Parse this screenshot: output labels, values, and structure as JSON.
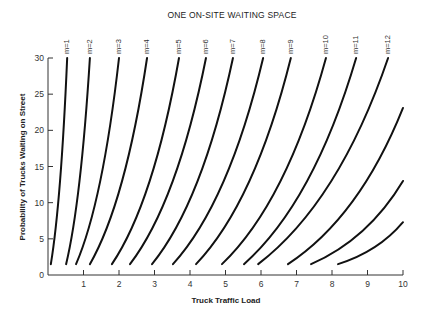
{
  "chart_data": {
    "type": "line",
    "title": "ONE ON-SITE WAITING SPACE",
    "xlabel": "Truck Traffic Load",
    "ylabel": "Probability of Trucks Waiting on Street",
    "xlim": [
      0,
      10
    ],
    "ylim": [
      0,
      30
    ],
    "x_ticks": [
      1,
      2,
      3,
      4,
      5,
      6,
      7,
      8,
      9,
      10
    ],
    "x_tick_labels": [
      "1",
      "2",
      "3",
      "4",
      "5",
      "6",
      "7",
      "8",
      "9",
      "10"
    ],
    "y_ticks": [
      0,
      5,
      10,
      15,
      20,
      25,
      30
    ],
    "y_tick_labels": [
      "0",
      "5",
      "10",
      "15",
      "20",
      "25",
      "30"
    ],
    "grid": false,
    "legend": "inline labels at top of each curve",
    "series": [
      {
        "name": "m=1",
        "start": [
          0.08,
          1.5
        ],
        "end": [
          0.54,
          30
        ]
      },
      {
        "name": "m=2",
        "start": [
          0.51,
          1.5
        ],
        "end": [
          1.18,
          30
        ]
      },
      {
        "name": "m=3",
        "start": [
          0.79,
          1.5
        ],
        "end": [
          2.0,
          30
        ]
      },
      {
        "name": "m=4",
        "start": [
          1.18,
          1.5
        ],
        "end": [
          2.79,
          30
        ]
      },
      {
        "name": "m=5",
        "start": [
          1.8,
          1.5
        ],
        "end": [
          3.69,
          30
        ]
      },
      {
        "name": "m=6",
        "start": [
          2.31,
          1.5
        ],
        "end": [
          4.45,
          30
        ]
      },
      {
        "name": "m=7",
        "start": [
          2.93,
          1.5
        ],
        "end": [
          5.21,
          30
        ]
      },
      {
        "name": "m=8",
        "start": [
          3.52,
          1.5
        ],
        "end": [
          6.06,
          30
        ]
      },
      {
        "name": "m=9",
        "start": [
          4.17,
          1.5
        ],
        "end": [
          6.84,
          30
        ]
      },
      {
        "name": "m=10",
        "start": [
          4.9,
          1.5
        ],
        "end": [
          7.83,
          30
        ]
      },
      {
        "name": "m=11",
        "start": [
          5.52,
          1.5
        ],
        "end": [
          8.68,
          30
        ]
      },
      {
        "name": "m=12",
        "start": [
          5.92,
          1.5
        ],
        "end": [
          9.58,
          30
        ]
      },
      {
        "name": "m=13",
        "start": [
          6.76,
          1.5
        ],
        "end": [
          10,
          23.1
        ],
        "unlabeled": true
      },
      {
        "name": "m=14",
        "start": [
          7.41,
          1.5
        ],
        "end": [
          10,
          13.0
        ],
        "unlabeled": true
      },
      {
        "name": "m=15",
        "start": [
          8.17,
          1.5
        ],
        "end": [
          10,
          7.3
        ],
        "unlabeled": true
      }
    ]
  }
}
